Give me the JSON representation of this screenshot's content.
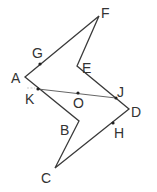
{
  "figure": {
    "type": "geometry-diagram",
    "polygon_order": [
      "A",
      "F",
      "E",
      "D",
      "C",
      "B"
    ],
    "vertices": {
      "A": {
        "label": "A",
        "x": 25,
        "y": 77
      },
      "F": {
        "label": "F",
        "x": 99,
        "y": 16
      },
      "E": {
        "label": "E",
        "x": 77,
        "y": 66
      },
      "D": {
        "label": "D",
        "x": 129,
        "y": 109
      },
      "C": {
        "label": "C",
        "x": 55,
        "y": 168
      },
      "B": {
        "label": "B",
        "x": 79,
        "y": 121
      }
    },
    "marked_points": {
      "G": {
        "label": "G",
        "x": 40,
        "y": 64,
        "on": "AF"
      },
      "K": {
        "label": "K",
        "x": 38,
        "y": 89,
        "on": "AB"
      },
      "O": {
        "label": "O",
        "x": 78,
        "y": 93,
        "on": "KJ"
      },
      "J": {
        "label": "J",
        "x": 116,
        "y": 98,
        "on": "ED"
      },
      "H": {
        "label": "H",
        "x": 113,
        "y": 123,
        "on": "DC"
      }
    },
    "segments": [
      {
        "from": "K",
        "to": "J",
        "through": "O"
      }
    ],
    "colors": {
      "line": "#3a3a3a",
      "point": "#222222",
      "label": "#333333",
      "background": "#ffffff"
    }
  }
}
